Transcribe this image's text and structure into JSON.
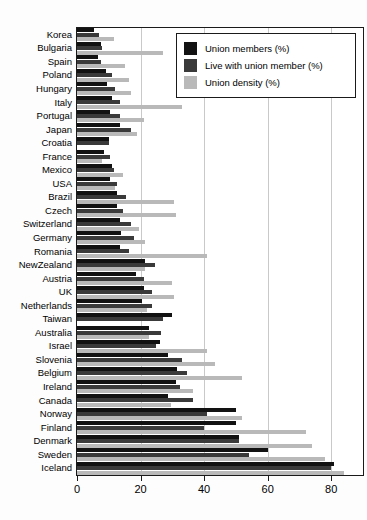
{
  "chart_data": {
    "type": "bar",
    "orientation": "horizontal",
    "title": "",
    "subtitle": "",
    "xlabel": "",
    "ylabel": "",
    "xlim": [
      0,
      90
    ],
    "xticks": [
      0,
      20,
      40,
      60,
      80
    ],
    "xtick_labels": [
      "0",
      "20",
      "40",
      "60",
      "80"
    ],
    "grid": "vertical",
    "legend_position": "top-right",
    "categories": [
      "Korea",
      "Bulgaria",
      "Spain",
      "Poland",
      "Hungary",
      "Italy",
      "Portugal",
      "Japan",
      "Croatia",
      "France",
      "Mexico",
      "USA",
      "Brazil",
      "Czech",
      "Switzerland",
      "Germany",
      "Romania",
      "NewZealand",
      "Austria",
      "UK",
      "Netherlands",
      "Taiwan",
      "Australia",
      "Israel",
      "Slovenia",
      "Belgium",
      "Ireland",
      "Canada",
      "Norway",
      "Finland",
      "Denmark",
      "Sweden",
      "Iceland"
    ],
    "series": [
      {
        "name": "Union members (%)",
        "color": "#121212",
        "values": [
          5.5,
          7.5,
          6.5,
          9.0,
          9.5,
          11.0,
          10.5,
          13.5,
          10.0,
          8.5,
          11.0,
          10.5,
          12.5,
          12.5,
          13.5,
          14.0,
          13.5,
          21.5,
          18.5,
          21.0,
          20.5,
          30.0,
          22.5,
          26.0,
          28.5,
          31.5,
          31.0,
          28.5,
          50.0,
          50.0,
          51.0,
          60.0,
          81.0
        ]
      },
      {
        "name": "Live with union member  (%)",
        "color": "#3a3a3a",
        "values": [
          7.0,
          8.0,
          7.5,
          11.0,
          12.0,
          13.5,
          13.5,
          17.0,
          10.0,
          10.5,
          11.5,
          12.5,
          15.5,
          14.5,
          17.0,
          18.0,
          16.5,
          24.5,
          21.0,
          23.5,
          23.5,
          27.0,
          26.5,
          25.0,
          33.0,
          34.5,
          32.5,
          36.5,
          41.0,
          40.0,
          51.0,
          54.0,
          80.0
        ]
      },
      {
        "name": "Union density (%)",
        "color": "#b9b9b9",
        "values": [
          11.5,
          27.0,
          15.0,
          16.5,
          17.0,
          33.0,
          21.0,
          19.0,
          0.0,
          8.0,
          14.5,
          12.0,
          30.5,
          31.0,
          19.5,
          21.5,
          41.0,
          21.5,
          30.0,
          30.5,
          22.0,
          0.0,
          22.5,
          41.0,
          43.5,
          52.0,
          36.5,
          29.5,
          52.0,
          72.0,
          74.0,
          78.0,
          84.0
        ]
      }
    ]
  },
  "legend": {
    "items": [
      {
        "label": "Union members (%)",
        "swatch_color": "#121212",
        "icon": "legend-swatch-dark"
      },
      {
        "label": "Live with union member  (%)",
        "swatch_color": "#3a3a3a",
        "icon": "legend-swatch-mid"
      },
      {
        "label": "Union density (%)",
        "swatch_color": "#b9b9b9",
        "icon": "legend-swatch-light"
      }
    ]
  }
}
